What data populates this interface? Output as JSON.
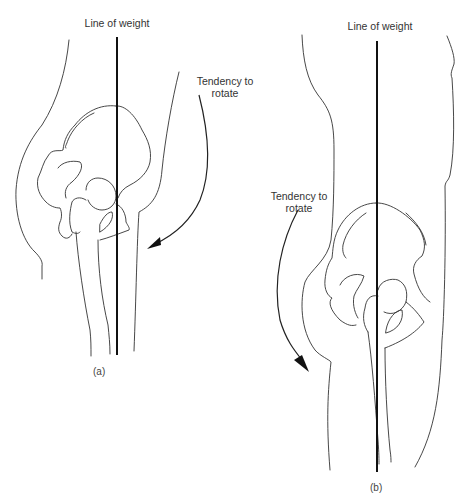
{
  "figure_a": {
    "line_label": "Line of weight",
    "rotation_label_line1": "Tendency to",
    "rotation_label_line2": "rotate",
    "caption": "(a)"
  },
  "figure_b": {
    "line_label": "Line of weight",
    "rotation_label_line1": "Tendency to",
    "rotation_label_line2": "rotate",
    "caption": "(b)"
  },
  "colors": {
    "background": "#ffffff",
    "line": "#333333",
    "weight_line": "#111111"
  }
}
